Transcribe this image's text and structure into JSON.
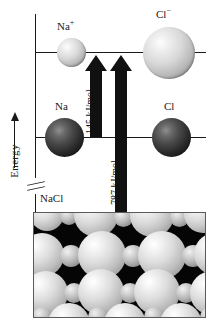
{
  "diagram": {
    "axis": {
      "label": "Energy",
      "arrow_direction": "up",
      "has_break": true,
      "break_symbol": "axis-break-icon"
    },
    "levels": [
      {
        "id": "ion-level",
        "label": "ionic species level"
      },
      {
        "id": "atom-level",
        "label": "neutral atom level"
      }
    ],
    "species": [
      {
        "id": "na-cation",
        "label": "Na",
        "charge": "+",
        "kind": "ion",
        "color": "#c9c9c9"
      },
      {
        "id": "cl-anion",
        "label": "Cl",
        "charge": "−",
        "kind": "ion",
        "color": "#d2d2d2"
      },
      {
        "id": "na-atom",
        "label": "Na",
        "charge": "",
        "kind": "atom",
        "color": "#2b2b2b"
      },
      {
        "id": "cl-atom",
        "label": "Cl",
        "charge": "",
        "kind": "atom",
        "color": "#2b2b2b"
      }
    ],
    "transitions": [
      {
        "id": "ionization-transition",
        "value": "145 kJ/mol",
        "direction": "up"
      },
      {
        "id": "lattice-transition",
        "value": "787 kJ/mol",
        "direction": "up"
      }
    ],
    "solid": {
      "label": "NaCl",
      "description": "ionic crystal lattice"
    },
    "colors": {
      "ink": "#1a1a1a",
      "arrow": "#111111",
      "crystal_background": "#050505",
      "ion_sphere": "#d5d5d5",
      "atom_sphere": "#2b2b2b"
    }
  }
}
